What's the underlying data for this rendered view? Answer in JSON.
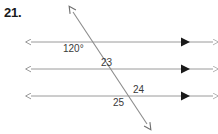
{
  "problem": {
    "number": "21."
  },
  "figure": {
    "type": "parallel-lines-transversal",
    "background_color": "#ffffff",
    "line_color": "#9a9a9a",
    "mark_color": "#1a1a1a",
    "labels": {
      "angle_120": "120°",
      "angle_23": "23",
      "angle_24": "24",
      "angle_25": "25"
    },
    "parallel_lines": [
      {
        "name": "line-1",
        "y": 42,
        "x_start": 31,
        "x_end": 213,
        "parallel_mark_x": 185
      },
      {
        "name": "line-2",
        "y": 69,
        "x_start": 31,
        "x_end": 213,
        "parallel_mark_x": 185
      },
      {
        "name": "line-3",
        "y": 96,
        "x_start": 31,
        "x_end": 213,
        "parallel_mark_x": 185
      }
    ],
    "transversal": {
      "name": "transversal",
      "x1": 73,
      "y1": 12,
      "x2": 147,
      "y2": 124
    },
    "intersections": [
      {
        "x": 96,
        "y": 42
      },
      {
        "x": 113,
        "y": 69
      },
      {
        "x": 131,
        "y": 96
      }
    ]
  }
}
